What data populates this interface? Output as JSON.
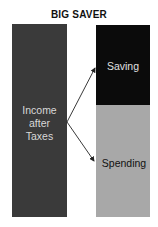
{
  "title": "BIG SAVER",
  "income": {
    "line1": "Income",
    "line2": "after",
    "line3": "Taxes"
  },
  "saving": {
    "label": "Saving"
  },
  "spending": {
    "label": "Spending"
  },
  "colors": {
    "income": "#3a3a3a",
    "saving": "#0b0b0b",
    "spending": "#a8a8a8"
  }
}
